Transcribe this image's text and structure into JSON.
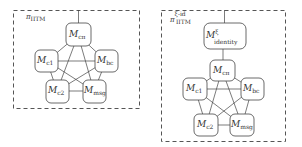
{
  "diagrams": [
    {
      "title_symbol": "π",
      "title_sub": "IITM",
      "title_sup": "",
      "nodes": {
        "c_pi": {
          "main": "M",
          "sub": "cπ"
        },
        "c1": {
          "main": "M",
          "sub": "c1"
        },
        "bc": {
          "main": "M",
          "sub": "bc"
        },
        "c2": {
          "main": "M",
          "sub": "c2"
        },
        "msg": {
          "main": "M",
          "sub": "msg"
        }
      }
    },
    {
      "title_symbol": "π",
      "title_sub": "IITM",
      "title_sup": "ξ-id",
      "nodes": {
        "identity": {
          "main": "M",
          "sup": "ξ",
          "sub": "identity"
        },
        "c_pi": {
          "main": "M",
          "sub": "cπ"
        },
        "c1": {
          "main": "M",
          "sub": "c1"
        },
        "bc": {
          "main": "M",
          "sub": "bc"
        },
        "c2": {
          "main": "M",
          "sub": "c2"
        },
        "msg": {
          "main": "M",
          "sub": "msg"
        }
      }
    }
  ]
}
